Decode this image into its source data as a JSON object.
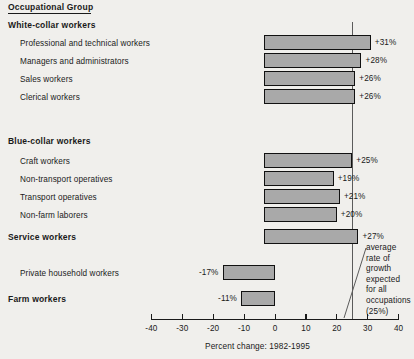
{
  "header": {
    "column_title": "Occupational Group"
  },
  "groups": [
    {
      "label": "White-collar workers"
    },
    {
      "label": "Blue-collar workers"
    },
    {
      "label": "Service workers"
    },
    {
      "label": "Farm workers"
    }
  ],
  "annotation": {
    "lines": [
      "average",
      "rate of",
      "growth",
      "expected",
      "for all",
      "occupations",
      "(25%)"
    ],
    "reference_value": 25
  },
  "axis": {
    "title": "Percent change:  1982-1995",
    "ticks": [
      -40,
      -30,
      -20,
      -10,
      0,
      10,
      20,
      30,
      40
    ],
    "tick_labels": [
      "-40",
      "-30",
      "-20",
      "-10",
      "0",
      "10",
      "20",
      "30",
      "40"
    ],
    "min": -40,
    "max": 40
  },
  "colors": {
    "background": "#f0efec",
    "bar_fill": "#a9a9a9",
    "bar_stroke": "#111111",
    "text": "#1a1a1a",
    "reference_line": "#5b5b5b"
  },
  "chart_data": {
    "type": "bar",
    "orientation": "horizontal",
    "title": "Occupational Group",
    "xlabel": "Percent change:  1982-1995",
    "ylabel": "Occupational Group",
    "xlim": [
      -40,
      40
    ],
    "grid": false,
    "legend": false,
    "reference_line": {
      "value": 25,
      "label": "average rate of growth expected for all occupations (25%)"
    },
    "bar_start_value": -3.5,
    "categories": [
      "Professional and technical workers",
      "Managers and administrators",
      "Sales workers",
      "Clerical workers",
      "Craft workers",
      "Non-transport operatives",
      "Transport operatives",
      "Non-farm laborers",
      "Service workers",
      "Private household workers",
      "Farm workers"
    ],
    "values": [
      31,
      28,
      26,
      26,
      25,
      19,
      21,
      20,
      27,
      -17,
      -11
    ],
    "data_labels": [
      "+31%",
      "+28%",
      "+26%",
      "+26%",
      "+25%",
      "+19%",
      "+21%",
      "+20%",
      "+27%",
      "-17%",
      "-11%"
    ],
    "group_of": [
      "White-collar workers",
      "White-collar workers",
      "White-collar workers",
      "White-collar workers",
      "Blue-collar workers",
      "Blue-collar workers",
      "Blue-collar workers",
      "Blue-collar workers",
      "Service workers",
      "Service workers",
      "Farm workers"
    ]
  },
  "layout": {
    "rows": [
      {
        "key": "professional",
        "label": "Professional and technical workers",
        "label_x": 20,
        "label_y": 44,
        "bar_y": 35,
        "indent": true
      },
      {
        "key": "managers",
        "label": "Managers and administrators",
        "label_x": 20,
        "label_y": 62,
        "bar_y": 53,
        "indent": true
      },
      {
        "key": "sales",
        "label": "Sales workers",
        "label_x": 20,
        "label_y": 80,
        "bar_y": 71,
        "indent": true
      },
      {
        "key": "clerical",
        "label": "Clerical workers",
        "label_x": 20,
        "label_y": 98,
        "bar_y": 89,
        "indent": true
      },
      {
        "key": "craft",
        "label": "Craft workers",
        "label_x": 20,
        "label_y": 162,
        "bar_y": 153,
        "indent": true
      },
      {
        "key": "nontransport",
        "label": "Non-transport operatives",
        "label_x": 20,
        "label_y": 180,
        "bar_y": 171,
        "indent": true
      },
      {
        "key": "transport",
        "label": "Transport operatives",
        "label_x": 20,
        "label_y": 198,
        "bar_y": 189,
        "indent": true
      },
      {
        "key": "nonfarm",
        "label": "Non-farm laborers",
        "label_x": 20,
        "label_y": 216,
        "bar_y": 207,
        "indent": true
      },
      {
        "key": "service",
        "label": "Service workers",
        "label_x": 8,
        "label_y": 238,
        "bar_y": 229,
        "indent": false
      },
      {
        "key": "household",
        "label": "Private household workers",
        "label_x": 20,
        "label_y": 274,
        "bar_y": 265,
        "indent": true
      },
      {
        "key": "farm",
        "label": "Farm workers",
        "label_x": 8,
        "label_y": 300,
        "bar_y": 291,
        "indent": false
      }
    ],
    "group_positions": [
      {
        "label": "White-collar workers",
        "x": 8,
        "y": 24
      },
      {
        "label": "Blue-collar workers",
        "x": 8,
        "y": 140
      },
      {
        "label": "Service workers",
        "x": 8,
        "y": 238
      },
      {
        "label": "Farm workers",
        "x": 8,
        "y": 300
      }
    ]
  }
}
